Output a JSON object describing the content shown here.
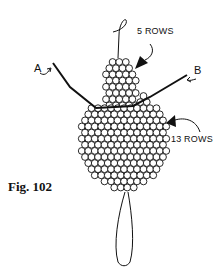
{
  "figure": {
    "caption": "Fig. 102",
    "labels": {
      "top_rows": "5 ROWS",
      "bottom_rows": "13 ROWS",
      "point_a": "A",
      "point_b": "B"
    },
    "colors": {
      "ink": "#111111",
      "background": "#ffffff"
    }
  }
}
